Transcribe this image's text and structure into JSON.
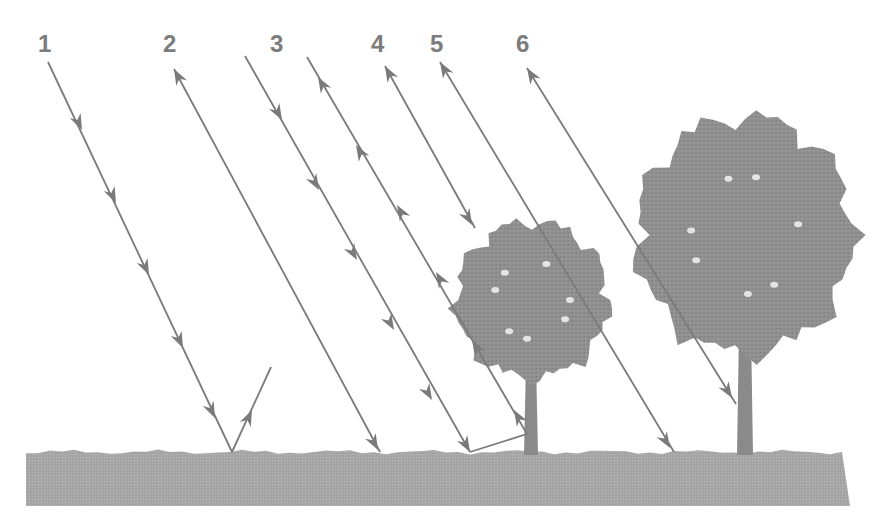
{
  "diagram": {
    "colors": {
      "line": "#7a7a7a",
      "ground": "#a8a8a8",
      "foliage": "#8e8e8e",
      "trunk": "#8a8a8a",
      "label": "#7c7c7c"
    },
    "labels": [
      {
        "id": "1",
        "text": "1",
        "x": 38,
        "y": 32
      },
      {
        "id": "2",
        "text": "2",
        "x": 163,
        "y": 32
      },
      {
        "id": "3",
        "text": "3",
        "x": 270,
        "y": 32
      },
      {
        "id": "4",
        "text": "4",
        "x": 371,
        "y": 32
      },
      {
        "id": "5",
        "text": "5",
        "x": 430,
        "y": 32
      },
      {
        "id": "6",
        "text": "6",
        "x": 516,
        "y": 32
      }
    ],
    "rays": [
      {
        "id": "ray-1-incoming",
        "from": [
          48,
          62
        ],
        "to": [
          232,
          452
        ],
        "arrows": [
          [
            82,
            130,
            "down"
          ],
          [
            116,
            203,
            "down"
          ],
          [
            149,
            275,
            "down"
          ],
          [
            183,
            348,
            "down"
          ],
          [
            215,
            418,
            "down"
          ]
        ]
      },
      {
        "id": "ray-1-reflected",
        "from": [
          232,
          452
        ],
        "to": [
          271,
          367
        ],
        "arrows": [
          [
            252,
            410,
            "up"
          ]
        ]
      },
      {
        "id": "ray-2",
        "from": [
          174,
          69
        ],
        "to": [
          380,
          452
        ],
        "arrows": [
          [
            174,
            69,
            "up"
          ],
          [
            378,
            450,
            "down"
          ]
        ]
      },
      {
        "id": "ray-3-incoming",
        "from": [
          245,
          56
        ],
        "to": [
          470,
          452
        ],
        "arrows": [
          [
            282,
            120,
            "down"
          ],
          [
            319,
            190,
            "down"
          ],
          [
            357,
            260,
            "down"
          ],
          [
            394,
            330,
            "down"
          ],
          [
            432,
            400,
            "down"
          ],
          [
            470,
            452,
            "down"
          ]
        ]
      },
      {
        "id": "ray-3-reflected-ground",
        "from": [
          470,
          452
        ],
        "to": [
          527,
          434
        ],
        "arrows": []
      },
      {
        "id": "ray-3-reflected-trunk",
        "from": [
          527,
          434
        ],
        "to": [
          307,
          57
        ],
        "arrows": [
          [
            514,
            410,
            "up"
          ],
          [
            472,
            340,
            "up"
          ],
          [
            436,
            272,
            "up"
          ],
          [
            397,
            205,
            "up"
          ],
          [
            356,
            145,
            "up"
          ],
          [
            318,
            77,
            "up"
          ]
        ]
      },
      {
        "id": "ray-4",
        "from": [
          385,
          66
        ],
        "to": [
          475,
          228
        ],
        "arrows": [
          [
            385,
            66,
            "up"
          ],
          [
            472,
            225,
            "down"
          ]
        ]
      },
      {
        "id": "ray-5",
        "from": [
          440,
          62
        ],
        "to": [
          674,
          452
        ],
        "arrows": [
          [
            440,
            62,
            "up"
          ],
          [
            670,
            448,
            "down"
          ]
        ]
      },
      {
        "id": "ray-6",
        "from": [
          527,
          68
        ],
        "to": [
          736,
          404
        ],
        "arrows": [
          [
            527,
            68,
            "up"
          ],
          [
            732,
            398,
            "down"
          ]
        ]
      }
    ],
    "ground": {
      "x": 26,
      "y": 452,
      "width": 824,
      "height": 54
    },
    "trees": [
      {
        "id": "small-tree",
        "crown_cx": 532,
        "crown_cy": 300,
        "crown_rx": 76,
        "crown_ry": 78,
        "trunk_x": 524,
        "trunk_top": 360,
        "trunk_bottom": 455,
        "trunk_w": 14
      },
      {
        "id": "large-tree",
        "crown_cx": 745,
        "crown_cy": 235,
        "crown_rx": 108,
        "crown_ry": 118,
        "trunk_x": 737,
        "trunk_top": 330,
        "trunk_bottom": 455,
        "trunk_w": 16
      }
    ]
  }
}
